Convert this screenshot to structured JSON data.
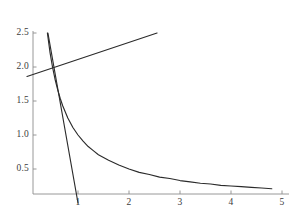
{
  "chart_data": {
    "type": "line",
    "title": "",
    "subtitle": "",
    "xlabel": "",
    "ylabel": "",
    "xlim": [
      0,
      5.1
    ],
    "ylim": [
      0,
      2.55
    ],
    "grid": false,
    "legend": "none",
    "background_color": "#ffffff",
    "axis_color": "#8c8c8c",
    "curve_color": "#2b2b2b",
    "xticks": [
      1,
      2,
      3,
      4,
      5
    ],
    "xtick_labels": [
      "1",
      "2",
      "3",
      "4",
      "5"
    ],
    "yticks": [
      0.5,
      1.0,
      1.5,
      2.0,
      2.5
    ],
    "ytick_labels": [
      "0.5",
      "1.0",
      "1.5",
      "2.0",
      "2.5"
    ],
    "series": [
      {
        "name": "reciprocal-curve",
        "type": "line",
        "equation": "y = 1/x",
        "color": "#2b2b2b",
        "x": [
          0.4,
          0.45,
          0.5,
          0.55,
          0.6,
          0.65,
          0.7,
          0.8,
          0.9,
          1.0,
          1.1,
          1.2,
          1.3,
          1.4,
          1.5,
          1.6,
          1.8,
          2.0,
          2.2,
          2.4,
          2.6,
          2.8,
          3.0,
          3.2,
          3.4,
          3.6,
          3.8,
          4.0,
          4.2,
          4.4,
          4.6,
          4.8
        ],
        "y": [
          2.5,
          2.22,
          2.0,
          1.82,
          1.67,
          1.54,
          1.43,
          1.25,
          1.11,
          1.0,
          0.91,
          0.83,
          0.77,
          0.71,
          0.67,
          0.63,
          0.56,
          0.5,
          0.45,
          0.42,
          0.38,
          0.36,
          0.33,
          0.31,
          0.29,
          0.28,
          0.26,
          0.25,
          0.24,
          0.23,
          0.22,
          0.21
        ]
      },
      {
        "name": "tangent-line",
        "type": "line",
        "equation": "steep descending line through (1, 0)",
        "color": "#2b2b2b",
        "x": [
          0.41,
          1.0
        ],
        "y": [
          2.5,
          0.0
        ]
      },
      {
        "name": "rising-line",
        "type": "line",
        "equation": "shallow ascending line",
        "color": "#2b2b2b",
        "x": [
          0.0,
          2.55
        ],
        "y": [
          1.86,
          2.5
        ]
      }
    ],
    "annotations": [
      {
        "name": "intersection-point",
        "x": 0.55,
        "y": 2.0,
        "label": ""
      }
    ]
  },
  "axes": {
    "x_axis_name": "x-axis",
    "y_axis_name": "y-axis"
  }
}
